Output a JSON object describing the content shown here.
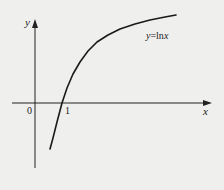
{
  "figure": {
    "function_label_var": "y",
    "function_label_eq": "=ln",
    "function_label_arg": "x",
    "x_axis_label": "x",
    "y_axis_label": "y",
    "origin_label": "0",
    "tick_label_1": "1"
  },
  "colors": {
    "background": "#efefed",
    "ink": "#222222"
  },
  "curve_points": "50,149 53,138 57,122 62,103 67,88 73,74 80,62 88,51 97,42 108,35 120,29 135,24 150,20 165,17 176,15"
}
